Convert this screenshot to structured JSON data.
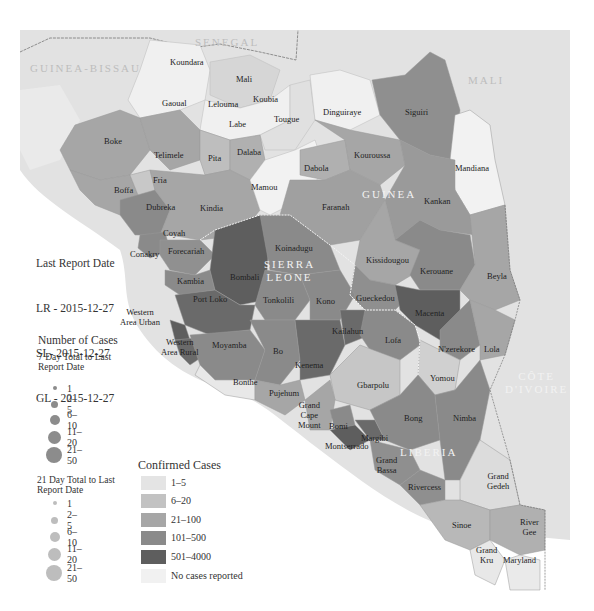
{
  "colors": {
    "sea": "#ffffff",
    "neighbor": "#e2e2e2",
    "c_1_5": "#dcdcdc",
    "c_6_20": "#bebebe",
    "c_21_100": "#a6a6a6",
    "c_101_500": "#8a8a8a",
    "c_501_4000": "#5e5e5e",
    "c_none": "#efefef",
    "dot7": "#8c8c8c",
    "dot21": "#bdbdbd"
  },
  "countries": {
    "senegal": "SENEGAL",
    "guinea_bissau": "GUINEA-BISSAU",
    "mali": "MALI",
    "guinea": "GUINEA",
    "sierra_leone": "SIERRA\nLEONE",
    "liberia": "LIBERIA",
    "cote_divoire": "CÔTE\nD'IVOIRE"
  },
  "regions": {
    "koundara": "Koundara",
    "mali": "Mali",
    "gaoual": "Gaoual",
    "lelouma": "Lelouma",
    "koubia": "Koubia",
    "labe": "Labe",
    "tougue": "Tougue",
    "dinguiraye": "Dinguiraye",
    "siguiri": "Siguiri",
    "boke": "Boke",
    "telimele": "Telimele",
    "pita": "Pita",
    "dalaba": "Dalaba",
    "boffa": "Boffa",
    "fria": "Fria",
    "mamou": "Mamou",
    "dabola": "Dabola",
    "kouroussa": "Kouroussa",
    "mandiana": "Mandiana",
    "dubreka": "Dubreka",
    "kindia": "Kindia",
    "faranah": "Faranah",
    "kankan": "Kankan",
    "coyah": "Coyah",
    "conakry": "Conakry",
    "forecariah": "Forecariah",
    "koinadugu": "Koinadugu",
    "kissidougou": "Kissidougou",
    "kerouane": "Kerouane",
    "beyla": "Beyla",
    "bombali": "Bombali",
    "kambia": "Kambia",
    "port_loko": "Port Loko",
    "tonkolili": "Tonkolili",
    "kono": "Kono",
    "gueckedou": "Gueckedou",
    "macenta": "Macenta",
    "western_urban": "Western\nArea Urban",
    "kailahun": "Kailahun",
    "western_rural": "Western\nArea Rural",
    "moyamba": "Moyamba",
    "bo": "Bo",
    "kenema": "Kenema",
    "lofa": "Lofa",
    "nzerekore": "N'zerekore",
    "lola": "Lola",
    "yomou": "Yomou",
    "bonthe": "Bonthe",
    "pujehum": "Pujehum",
    "gbarpolu": "Gbarpolu",
    "grand_cape_mount": "Grand\nCape\nMount",
    "bomi": "Bomi",
    "bong": "Bong",
    "nimba": "Nimba",
    "margibi": "Margibi",
    "montserrado": "Montserrado",
    "grand_bassa": "Grand\nBassa",
    "rivercess": "Rivercess",
    "grand_gedeh": "Grand\nGedeh",
    "sinoe": "Sinoe",
    "river_gee": "River\nGee",
    "grand_kru": "Grand\nKru",
    "maryland": "Maryland"
  },
  "report": {
    "title": "Last Report Date",
    "lr": "LR - 2015-12-27",
    "sl": "SL- 2015-12-27",
    "gl": "GL - 2015-12-27"
  },
  "legend_cases": {
    "title": "Number of Cases",
    "seven_day_title": "7 Day Total to Last\nReport Date",
    "twentyone_day_title": "21 Day Total to Last\nReport Date",
    "bins": [
      "1",
      "2–5",
      "6–10",
      "11–20",
      "21–50"
    ]
  },
  "legend_confirmed": {
    "title": "Confirmed Cases",
    "bins": [
      "1–5",
      "6–20",
      "21–100",
      "101–500",
      "501–4000",
      "No cases reported"
    ]
  }
}
